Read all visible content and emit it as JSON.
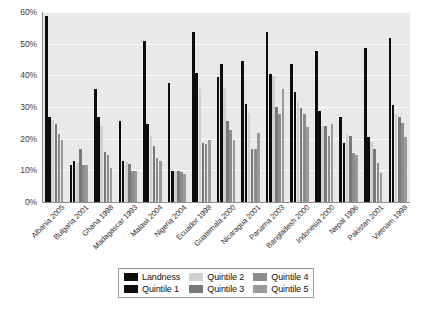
{
  "chart_data": {
    "type": "bar",
    "title": "",
    "subtitle": "",
    "xlabel": "",
    "ylabel": "",
    "ylim": [
      0,
      60
    ],
    "yunit": "%",
    "grid": true,
    "legend_position": "bottom",
    "y_ticks": [
      "0%",
      "10%",
      "20%",
      "30%",
      "40%",
      "50%",
      "60%"
    ],
    "y_tick_values": [
      0,
      10,
      20,
      30,
      40,
      50,
      60
    ],
    "categories": [
      "Albania 2005",
      "Bulgaria 2001",
      "Ghana 1998",
      "Madagascar 1993",
      "Malawi 2004",
      "Nigeria 2004",
      "Ecuador 1998",
      "Guatemala 2000",
      "Nicaragua 2001",
      "Panama 2003",
      "Bangladesh 2000",
      "Indonesia 2000",
      "Nepal 1996",
      "Pakistan 2001",
      "Vietnam 1998"
    ],
    "series": [
      {
        "name": "Landness",
        "color": "#0d0d0d",
        "values": [
          58.6,
          11.8,
          35.7,
          25.7,
          50.7,
          37.6,
          53.7,
          39.6,
          44.6,
          53.7,
          43.6,
          47.7,
          26.7,
          48.7,
          51.7
        ]
      },
      {
        "name": "Quintile 1",
        "color": "#0d0d0d",
        "values": [
          26.7,
          12.8,
          26.8,
          12.9,
          24.7,
          9.9,
          40.6,
          43.6,
          30.8,
          40.5,
          34.7,
          28.8,
          18.7,
          20.6,
          30.7
        ]
      },
      {
        "name": "Quintile 2",
        "color": "#d0d0d0",
        "values": [
          25.9,
          12.4,
          24.0,
          12.6,
          20.7,
          9.7,
          35.6,
          35.9,
          28.0,
          39.7,
          31.8,
          23.9,
          21.4,
          19.0,
          27.8
        ]
      },
      {
        "name": "Quintile 3",
        "color": "#787878",
        "values": [
          24.7,
          16.7,
          15.9,
          12.1,
          17.8,
          9.8,
          18.7,
          25.6,
          16.8,
          29.9,
          29.6,
          23.9,
          20.8,
          16.6,
          26.9
        ]
      },
      {
        "name": "Quintile 4",
        "color": "#8c8c8c",
        "values": [
          21.6,
          11.8,
          14.9,
          9.8,
          14.0,
          9.6,
          18.2,
          22.6,
          16.6,
          27.9,
          27.7,
          20.8,
          15.6,
          12.2,
          24.8
        ]
      },
      {
        "name": "Quintile 5",
        "color": "#9a9a9a",
        "values": [
          19.6,
          11.7,
          10.8,
          9.7,
          12.8,
          8.9,
          19.7,
          19.7,
          21.8,
          35.8,
          23.8,
          24.6,
          14.7,
          9.1,
          20.6
        ]
      }
    ]
  },
  "legend": {
    "entries": [
      {
        "label": "Landness",
        "color": "#0d0d0d"
      },
      {
        "label": "Quintile 1",
        "color": "#0d0d0d"
      },
      {
        "label": "Quintile 2",
        "color": "#d0d0d0"
      },
      {
        "label": "Quintile 3",
        "color": "#787878"
      },
      {
        "label": "Quintile 4",
        "color": "#8c8c8c"
      },
      {
        "label": "Quintile 5",
        "color": "#9a9a9a"
      }
    ]
  },
  "style": {
    "plot_background": "#e9e9e9",
    "gridline_color": "#fbfbfb",
    "axis_color": "#8d8d8d",
    "text_color": "#2e2e2e"
  }
}
